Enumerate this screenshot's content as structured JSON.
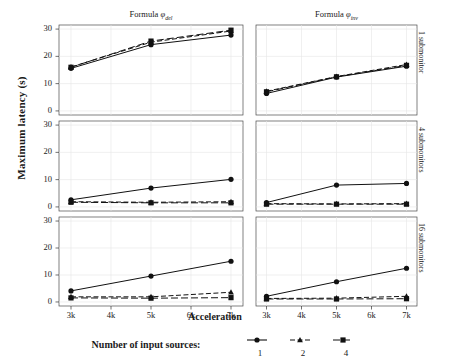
{
  "chart_data": {
    "type": "line",
    "title": "",
    "xlabel": "Acceleration",
    "ylabel": "Maximum latency (s)",
    "x": [
      3000,
      5000,
      7000
    ],
    "xtick_labels": [
      "3k",
      "4k",
      "5k",
      "6k",
      "7k"
    ],
    "xtick_values": [
      3000,
      4000,
      5000,
      6000,
      7000
    ],
    "xlim": [
      2700,
      7300
    ],
    "ytick_labels": [
      "0",
      "10",
      "20",
      "30"
    ],
    "ytick_values": [
      0,
      10,
      20,
      30
    ],
    "ylim": [
      -1.5,
      31.5
    ],
    "grid": true,
    "legend": {
      "title": "Number of input sources:",
      "position": "bottom",
      "entries": [
        {
          "label": "1",
          "marker": "circle",
          "dash": "solid"
        },
        {
          "label": "2",
          "marker": "triangle",
          "dash": "dashed"
        },
        {
          "label": "4",
          "marker": "square",
          "dash": "longdash"
        }
      ]
    },
    "col_titles": [
      {
        "prefix": "Formula ",
        "symbol": "φ",
        "sub": "del"
      },
      {
        "prefix": "Formula ",
        "symbol": "φ",
        "sub": "inv"
      }
    ],
    "row_titles": [
      "1 submonitor",
      "4 submonitors",
      "16 submonitors"
    ],
    "panels": [
      {
        "row": 0,
        "col": 0,
        "row_title": "1 submonitor",
        "col_title": "Formula φ_del",
        "series": [
          {
            "name": "1",
            "values": [
              15.6,
              24.3,
              27.8
            ]
          },
          {
            "name": "2",
            "values": [
              16.1,
              25.2,
              29.3
            ]
          },
          {
            "name": "4",
            "values": [
              16.0,
              25.6,
              29.6
            ]
          }
        ]
      },
      {
        "row": 0,
        "col": 1,
        "row_title": "1 submonitor",
        "col_title": "Formula φ_inv",
        "series": [
          {
            "name": "1",
            "values": [
              6.4,
              12.4,
              16.4
            ]
          },
          {
            "name": "2",
            "values": [
              7.2,
              12.6,
              17.0
            ]
          },
          {
            "name": "4",
            "values": [
              7.0,
              12.5,
              16.7
            ]
          }
        ]
      },
      {
        "row": 1,
        "col": 0,
        "row_title": "4 submonitors",
        "col_title": "Formula φ_del",
        "series": [
          {
            "name": "1",
            "values": [
              2.6,
              6.9,
              10.1
            ]
          },
          {
            "name": "2",
            "values": [
              1.9,
              1.7,
              1.9
            ]
          },
          {
            "name": "4",
            "values": [
              1.7,
              1.5,
              1.5
            ]
          }
        ]
      },
      {
        "row": 1,
        "col": 1,
        "row_title": "4 submonitors",
        "col_title": "Formula φ_inv",
        "series": [
          {
            "name": "1",
            "values": [
              1.6,
              8.0,
              8.6
            ]
          },
          {
            "name": "2",
            "values": [
              1.2,
              1.1,
              1.2
            ]
          },
          {
            "name": "4",
            "values": [
              1.0,
              1.0,
              1.0
            ]
          }
        ]
      },
      {
        "row": 2,
        "col": 0,
        "row_title": "16 submonitors",
        "col_title": "Formula φ_del",
        "series": [
          {
            "name": "1",
            "values": [
              4.1,
              9.6,
              15.1
            ]
          },
          {
            "name": "2",
            "values": [
              1.9,
              1.9,
              3.6
            ]
          },
          {
            "name": "4",
            "values": [
              1.5,
              1.4,
              1.6
            ]
          }
        ]
      },
      {
        "row": 2,
        "col": 1,
        "row_title": "16 submonitors",
        "col_title": "Formula φ_inv",
        "series": [
          {
            "name": "1",
            "values": [
              2.1,
              7.5,
              12.5
            ]
          },
          {
            "name": "2",
            "values": [
              1.3,
              1.4,
              2.1
            ]
          },
          {
            "name": "4",
            "values": [
              1.1,
              1.1,
              1.2
            ]
          }
        ]
      }
    ]
  }
}
